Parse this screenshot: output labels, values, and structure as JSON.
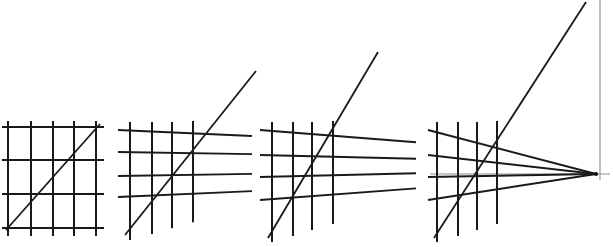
{
  "figure": {
    "description": "Four square-grid panels showing progressive one-point perspective foreshortening, from a flat frontal grid to a grid whose orthogonals converge on a visible vanishing point at the right.",
    "canvas": {
      "width": 613,
      "height": 247,
      "background": "#ffffff"
    },
    "colors": {
      "grid_stroke": "#1a1a1a",
      "guide_stroke": "#8e8e8e",
      "vanishing_point": "#111111",
      "background": "#ffffff"
    },
    "panels": [
      {
        "name": "panel-1-frontal-grid",
        "label": "",
        "perspective": "none",
        "vanishing_point": null,
        "verticals_x": [
          8,
          31,
          53,
          74,
          96
        ],
        "vertical_span_y": [
          121,
          236
        ],
        "horizontals_y": [
          127,
          160,
          194,
          228
        ],
        "horizontal_span_x": [
          2,
          104
        ],
        "diagonal": {
          "x1": 6,
          "y1": 230,
          "x2": 100,
          "y2": 124
        }
      },
      {
        "name": "panel-2-slight-perspective",
        "label": "",
        "perspective": "one-point, vanishing point far off-frame right",
        "vanishing_point": null,
        "verticals_x": [
          130,
          152,
          172,
          193
        ],
        "vertical_span_y": [
          122,
          240
        ],
        "horizontals_y": [
          130,
          152,
          176,
          197
        ],
        "horizontal_span_x": [
          118,
          252
        ],
        "diagonal": {
          "x1": 125,
          "y1": 235,
          "x2": 256,
          "y2": 71
        }
      },
      {
        "name": "panel-3-moderate-perspective",
        "label": "",
        "perspective": "one-point, vanishing point off-frame right",
        "vanishing_point": null,
        "verticals_x": [
          272,
          293,
          312,
          333
        ],
        "vertical_span_y": [
          122,
          242
        ],
        "horizontals_y": [
          130,
          155,
          177,
          200
        ],
        "horizontal_span_x": [
          260,
          416
        ],
        "diagonal": {
          "x1": 268,
          "y1": 238,
          "x2": 378,
          "y2": 52
        }
      },
      {
        "name": "panel-4-full-perspective",
        "label": "",
        "perspective": "one-point, vanishing point visible on the horizon",
        "vanishing_point": {
          "x": 596,
          "y": 174
        },
        "verticals_x": [
          437,
          458,
          477,
          497
        ],
        "vertical_span_y": [
          122,
          242
        ],
        "horizontals_y": [
          130,
          155,
          177,
          200
        ],
        "horizontal_span_x": [
          428,
          596
        ],
        "diagonal": {
          "x1": 434,
          "y1": 238,
          "x2": 586,
          "y2": 2
        },
        "guides": {
          "picture_plane_vertical": {
            "x": 600,
            "y1": 0,
            "y2": 180
          },
          "horizon_line": {
            "y": 174,
            "x1": 430,
            "x2": 610
          }
        }
      }
    ]
  }
}
